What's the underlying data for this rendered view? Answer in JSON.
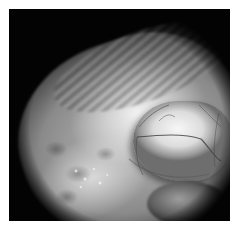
{
  "image": {
    "kind": "grayscale endoscopic tissue photograph",
    "colors": {
      "page_background": "#ffffff",
      "frame_background": "#030303",
      "tissue_highlight": "#f2f2f2",
      "tissue_mid": "#8a8a8a",
      "vessel": "#3c3c3c"
    }
  }
}
